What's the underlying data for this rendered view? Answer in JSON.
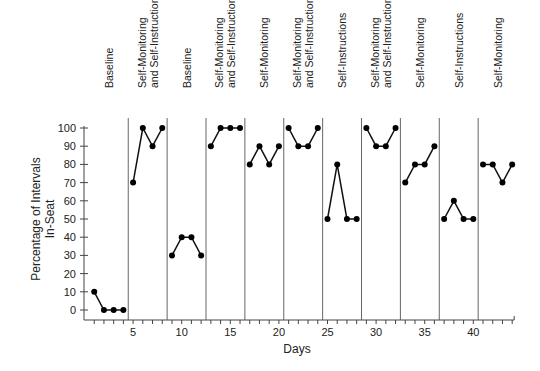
{
  "chart_data": {
    "type": "line",
    "title": "",
    "xlabel": "Days",
    "ylabel": "Percentage of Intervals In-Seat",
    "ylabel_lines": [
      "Percentage of Intervals",
      "In-Seat"
    ],
    "xlim": [
      0,
      44
    ],
    "ylim": [
      0,
      100
    ],
    "x_ticks": [
      5,
      10,
      15,
      20,
      25,
      30,
      35,
      40
    ],
    "y_ticks": [
      0,
      10,
      20,
      30,
      40,
      50,
      60,
      70,
      80,
      90,
      100
    ],
    "grid": false,
    "legend": "none",
    "phase_change_lines": [
      4.5,
      8.5,
      12.5,
      16.5,
      20.5,
      24.5,
      28.5,
      32.5,
      36.5,
      40.5
    ],
    "phases": [
      {
        "label_lines": [
          "Baseline"
        ],
        "x": [
          1,
          2,
          3,
          4
        ],
        "values": [
          10,
          0,
          0,
          0
        ]
      },
      {
        "label_lines": [
          "Self-Monitoring",
          "and Self-Instructions"
        ],
        "x": [
          5,
          6,
          7,
          8
        ],
        "values": [
          70,
          100,
          90,
          100
        ]
      },
      {
        "label_lines": [
          "Baseline"
        ],
        "x": [
          9,
          10,
          11,
          12
        ],
        "values": [
          30,
          40,
          40,
          30
        ]
      },
      {
        "label_lines": [
          "Self-Monitoring",
          "and Self-Instructions"
        ],
        "x": [
          13,
          14,
          15,
          16
        ],
        "values": [
          90,
          100,
          100,
          100
        ]
      },
      {
        "label_lines": [
          "Self-Monitoring"
        ],
        "x": [
          17,
          18,
          19,
          20
        ],
        "values": [
          80,
          90,
          80,
          90
        ]
      },
      {
        "label_lines": [
          "Self-Monitoring",
          "and Self-Instructions"
        ],
        "x": [
          21,
          22,
          23,
          24
        ],
        "values": [
          100,
          90,
          90,
          100
        ]
      },
      {
        "label_lines": [
          "Self-Instructions"
        ],
        "x": [
          25,
          26,
          27,
          28
        ],
        "values": [
          50,
          80,
          50,
          50
        ]
      },
      {
        "label_lines": [
          "Self-Monitoring",
          "and Self-Instructions"
        ],
        "x": [
          29,
          30,
          31,
          32
        ],
        "values": [
          100,
          90,
          90,
          100
        ]
      },
      {
        "label_lines": [
          "Self-Monitoring"
        ],
        "x": [
          33,
          34,
          35,
          36
        ],
        "values": [
          70,
          80,
          80,
          90
        ]
      },
      {
        "label_lines": [
          "Self-Instructions"
        ],
        "x": [
          37,
          38,
          39,
          40
        ],
        "values": [
          50,
          60,
          50,
          50
        ]
      },
      {
        "label_lines": [
          "Self-Monitoring"
        ],
        "x": [
          41,
          42,
          43,
          44
        ],
        "values": [
          80,
          80,
          70,
          80
        ]
      }
    ]
  },
  "layout": {
    "plot_left": 84,
    "plot_bottom": 320,
    "x0_px": 84.5,
    "px_per_day": 9.72,
    "y0_px": 310,
    "px_per_unit": 1.82,
    "phase_line_top": 118,
    "label_bottom_y": 88,
    "colors": {
      "line": "#111111",
      "marker": "#000000",
      "axis": "#444444",
      "phase_line": "#555555"
    }
  }
}
